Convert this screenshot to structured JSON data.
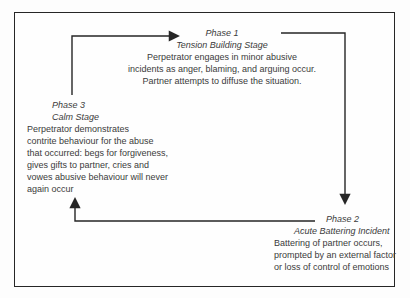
{
  "diagram": {
    "colors": {
      "ink": "#3b3b3b",
      "line": "#262626",
      "background": "#fdfdfd"
    },
    "phases": [
      {
        "name": "Phase 1",
        "stage": "Tension Building Stage",
        "lines": [
          "Perpetrator engages in minor abusive",
          "incidents as anger, blaming, and arguing occur.",
          "Partner attempts to diffuse the situation."
        ]
      },
      {
        "name": "Phase 2",
        "stage": "Acute Battering Incident",
        "lines": [
          "Battering of partner occurs,",
          "prompted by an external factor",
          "or loss of control of emotions"
        ]
      },
      {
        "name": "Phase 3",
        "stage": "Calm Stage",
        "lines": [
          "Perpetrator demonstrates",
          "contrite behaviour for the abuse",
          "that occurred: begs for forgiveness,",
          "gives gifts to partner, cries and",
          "vowes abusive behaviour will never",
          "again occur"
        ]
      }
    ],
    "arrows": [
      {
        "from": "Phase 3",
        "to": "Phase 1"
      },
      {
        "from": "Phase 1",
        "to": "Phase 2"
      },
      {
        "from": "Phase 2",
        "to": "Phase 3"
      }
    ]
  }
}
